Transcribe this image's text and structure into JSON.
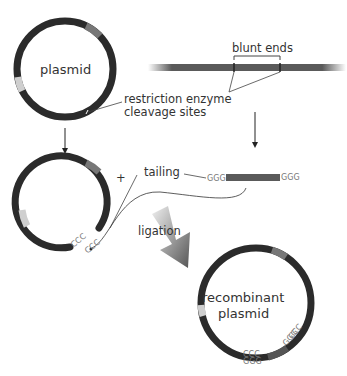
{
  "diagram": {
    "labels": {
      "plasmid": "plasmid",
      "blunt_ends": "blunt ends",
      "restriction_sites_line1": "restriction enzyme",
      "restriction_sites_line2": "cleavage sites",
      "plus": "+",
      "tailing": "tailing",
      "ligation": "ligation",
      "recombinant_line1": "recombinant",
      "recombinant_line2": "plasmid"
    },
    "sequences": {
      "fragment_left_tail": "GGG",
      "fragment_right_tail": "GGG",
      "plasmid_tail_1": "CCC",
      "plasmid_tail_2": "CCC",
      "recombinant_ccc_1": "CCC",
      "recombinant_ggg_1": "GGG",
      "recombinant_ccc_2": "CCC",
      "recombinant_ggg_2": "GGG"
    },
    "colors": {
      "plasmid_ring": "#2b2b2b",
      "marker_gray": "#777777",
      "marker_light": "#cfcfcf",
      "dna_strand": "#5a5a5a",
      "ligation_arrow_start": "#e8e8e8",
      "ligation_arrow_end": "#555555"
    }
  }
}
